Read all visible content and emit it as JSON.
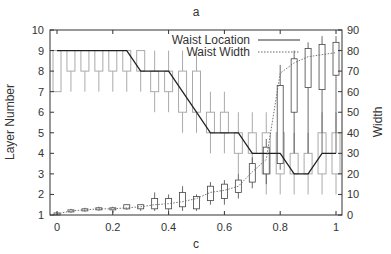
{
  "chart_data": {
    "type": "box",
    "title": "a",
    "xlabel": "c",
    "ylabel_left": "Layer Number",
    "ylabel_right": "Width",
    "xlim": [
      0,
      1
    ],
    "ylim_left": [
      1,
      10
    ],
    "ylim_right": [
      0,
      90
    ],
    "x_ticks": [
      "0",
      "0.2",
      "0.4",
      "0.6",
      "0.8",
      "1"
    ],
    "y_left_ticks": [
      "1",
      "2",
      "3",
      "4",
      "5",
      "6",
      "7",
      "8",
      "9",
      "10"
    ],
    "y_right_ticks": [
      "0",
      "10",
      "20",
      "30",
      "40",
      "50",
      "60",
      "70",
      "80",
      "90"
    ],
    "grid": false,
    "legend": {
      "position": "top-center",
      "entries": [
        {
          "label": "Waist Location",
          "style": "solid"
        },
        {
          "label": "Waist Width",
          "style": "dotted"
        }
      ]
    },
    "x": [
      0,
      0.05,
      0.1,
      0.15,
      0.2,
      0.25,
      0.3,
      0.35,
      0.4,
      0.45,
      0.5,
      0.55,
      0.6,
      0.65,
      0.7,
      0.75,
      0.8,
      0.85,
      0.9,
      0.95,
      1.0
    ],
    "series": [
      {
        "name": "Waist Location",
        "axis": "right",
        "style": "solid",
        "values": [
          80,
          80,
          80,
          80,
          80,
          80,
          70,
          70,
          70,
          60,
          50,
          40,
          40,
          40,
          30,
          30,
          30,
          20,
          20,
          30,
          30
        ]
      },
      {
        "name": "Waist Width",
        "axis": "right",
        "style": "dotted",
        "values": [
          0.5,
          2,
          2.5,
          3,
          3,
          3.5,
          4,
          5,
          5.5,
          6.5,
          8,
          11,
          12,
          14,
          21,
          27,
          69,
          74,
          77,
          78,
          79
        ]
      }
    ],
    "layer_boxes": [
      {
        "x": 0,
        "q1": 7,
        "q3": 9,
        "lo": 7,
        "hi": 9
      },
      {
        "x": 0.05,
        "q1": 8,
        "q3": 9,
        "lo": 7,
        "hi": 9
      },
      {
        "x": 0.1,
        "q1": 8,
        "q3": 9,
        "lo": 7,
        "hi": 9
      },
      {
        "x": 0.15,
        "q1": 8,
        "q3": 9,
        "lo": 7,
        "hi": 9
      },
      {
        "x": 0.2,
        "q1": 8,
        "q3": 9,
        "lo": 7,
        "hi": 9
      },
      {
        "x": 0.25,
        "q1": 8,
        "q3": 9,
        "lo": 7,
        "hi": 9
      },
      {
        "x": 0.3,
        "q1": 8,
        "q3": 9,
        "lo": 7,
        "hi": 9
      },
      {
        "x": 0.35,
        "q1": 7,
        "q3": 8,
        "lo": 6,
        "hi": 9
      },
      {
        "x": 0.4,
        "q1": 7,
        "q3": 8,
        "lo": 6,
        "hi": 9
      },
      {
        "x": 0.45,
        "q1": 6,
        "q3": 8,
        "lo": 5,
        "hi": 9
      },
      {
        "x": 0.5,
        "q1": 6,
        "q3": 8,
        "lo": 5,
        "hi": 9
      },
      {
        "x": 0.55,
        "q1": 5,
        "q3": 6,
        "lo": 4,
        "hi": 7
      },
      {
        "x": 0.6,
        "q1": 5,
        "q3": 6,
        "lo": 4,
        "hi": 7
      },
      {
        "x": 0.65,
        "q1": 4,
        "q3": 5,
        "lo": 3,
        "hi": 6
      },
      {
        "x": 0.7,
        "q1": 4,
        "q3": 5,
        "lo": 3,
        "hi": 6
      },
      {
        "x": 0.75,
        "q1": 3,
        "q3": 5,
        "lo": 2,
        "hi": 6
      },
      {
        "x": 0.8,
        "q1": 3,
        "q3": 5,
        "lo": 2,
        "hi": 6
      },
      {
        "x": 0.85,
        "q1": 3,
        "q3": 4,
        "lo": 2,
        "hi": 5
      },
      {
        "x": 0.9,
        "q1": 3,
        "q3": 4,
        "lo": 2,
        "hi": 5
      },
      {
        "x": 0.95,
        "q1": 3,
        "q3": 5,
        "lo": 2,
        "hi": 6
      },
      {
        "x": 1.0,
        "q1": 3,
        "q3": 5,
        "lo": 2,
        "hi": 6
      }
    ],
    "width_boxes": [
      {
        "x": 0,
        "q1": 0,
        "q3": 1,
        "lo": 0,
        "hi": 1
      },
      {
        "x": 0.05,
        "q1": 1.5,
        "q3": 2.5,
        "lo": 1,
        "hi": 3
      },
      {
        "x": 0.1,
        "q1": 2,
        "q3": 3,
        "lo": 1.5,
        "hi": 3.5
      },
      {
        "x": 0.15,
        "q1": 2.5,
        "q3": 3.5,
        "lo": 2,
        "hi": 4
      },
      {
        "x": 0.2,
        "q1": 2.5,
        "q3": 3.5,
        "lo": 1,
        "hi": 4
      },
      {
        "x": 0.25,
        "q1": 3,
        "q3": 5,
        "lo": 2.5,
        "hi": 5
      },
      {
        "x": 0.3,
        "q1": 3,
        "q3": 5,
        "lo": 2,
        "hi": 5
      },
      {
        "x": 0.35,
        "q1": 3,
        "q3": 8,
        "lo": 2,
        "hi": 11
      },
      {
        "x": 0.4,
        "q1": 3,
        "q3": 8,
        "lo": 2,
        "hi": 10
      },
      {
        "x": 0.45,
        "q1": 4,
        "q3": 11,
        "lo": 2,
        "hi": 14
      },
      {
        "x": 0.5,
        "q1": 3,
        "q3": 9,
        "lo": 2,
        "hi": 10
      },
      {
        "x": 0.55,
        "q1": 7,
        "q3": 14,
        "lo": 5,
        "hi": 16
      },
      {
        "x": 0.6,
        "q1": 8,
        "q3": 15,
        "lo": 5,
        "hi": 17
      },
      {
        "x": 0.65,
        "q1": 11,
        "q3": 17,
        "lo": 8,
        "hi": 20
      },
      {
        "x": 0.7,
        "q1": 16,
        "q3": 25,
        "lo": 13,
        "hi": 28
      },
      {
        "x": 0.75,
        "q1": 20,
        "q3": 33,
        "lo": 15,
        "hi": 37
      },
      {
        "x": 0.8,
        "q1": 25,
        "q3": 63,
        "lo": 22,
        "hi": 73
      },
      {
        "x": 0.85,
        "q1": 50,
        "q3": 76,
        "lo": 30,
        "hi": 80
      },
      {
        "x": 0.9,
        "q1": 62,
        "q3": 81,
        "lo": 30,
        "hi": 84
      },
      {
        "x": 0.95,
        "q1": 61,
        "q3": 83,
        "lo": 30,
        "hi": 87
      },
      {
        "x": 1.0,
        "q1": 68,
        "q3": 84,
        "lo": 30,
        "hi": 87
      }
    ]
  }
}
